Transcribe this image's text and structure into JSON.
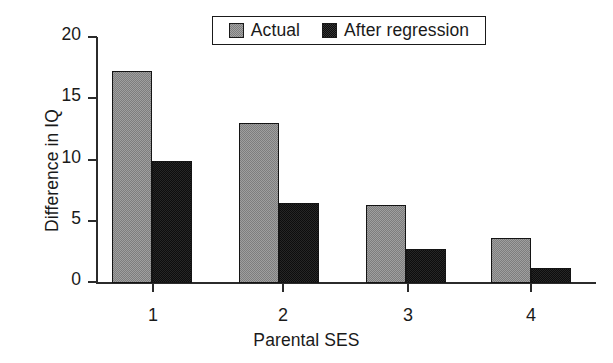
{
  "chart_data": {
    "type": "bar",
    "title": "",
    "xlabel": "Parental SES",
    "ylabel": "Difference in IQ",
    "categories": [
      "1",
      "2",
      "3",
      "4"
    ],
    "series": [
      {
        "name": "Actual",
        "color": "#7d7d7d",
        "values": [
          17.3,
          13.1,
          6.4,
          3.7
        ]
      },
      {
        "name": "After regression",
        "color": "#0d0d0d",
        "values": [
          10.0,
          6.5,
          2.8,
          1.2
        ]
      }
    ],
    "ylim": [
      0,
      20
    ],
    "yticks": [
      0,
      5,
      10,
      15,
      20
    ],
    "ytick_labels": [
      "0",
      "5",
      "10",
      "15",
      "20"
    ],
    "grid": false,
    "legend_position": "top-center",
    "legend_entries": [
      "Actual",
      "After regression"
    ]
  }
}
